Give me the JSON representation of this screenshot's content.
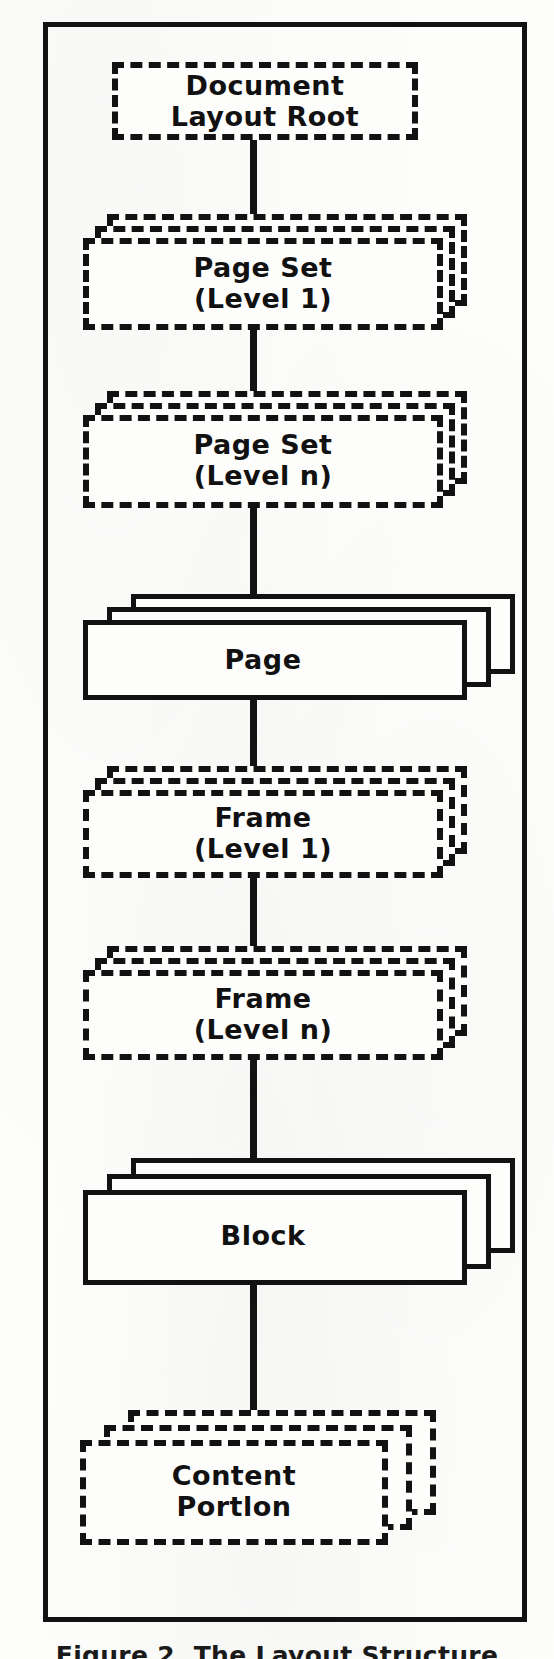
{
  "figure": {
    "caption": "Figure 2. The Layout Structure",
    "border_color": "#121212",
    "paper_color": "#fdfdfc",
    "ink_color": "#121212"
  },
  "diagram": {
    "type": "tree-hierarchy",
    "orientation": "vertical",
    "node_count": 8,
    "connector_count": 7,
    "nodes": [
      {
        "id": "document-layout-root",
        "label": "Document\nLayout Root",
        "line_style": "dashed",
        "stack_layers": 1,
        "x": 112,
        "y": 62,
        "width": 306,
        "height": 78
      },
      {
        "id": "page-set-level-1",
        "label": "Page Set\n(Level 1)",
        "line_style": "dashed",
        "stack_layers": 3,
        "x": 83,
        "y": 238,
        "width": 360,
        "height": 92
      },
      {
        "id": "page-set-level-n",
        "label": "Page Set\n(Level n)",
        "line_style": "dashed",
        "stack_layers": 3,
        "x": 83,
        "y": 415,
        "width": 360,
        "height": 93
      },
      {
        "id": "page",
        "label": "Page",
        "line_style": "solid",
        "stack_layers": 3,
        "x": 83,
        "y": 620,
        "width": 384,
        "height": 80
      },
      {
        "id": "frame-level-1",
        "label": "Frame\n(Level 1)",
        "line_style": "dashed",
        "stack_layers": 3,
        "x": 83,
        "y": 790,
        "width": 360,
        "height": 88
      },
      {
        "id": "frame-level-n",
        "label": "Frame\n(Level n)",
        "line_style": "dashed",
        "stack_layers": 3,
        "x": 83,
        "y": 970,
        "width": 360,
        "height": 90
      },
      {
        "id": "block",
        "label": "Block",
        "line_style": "solid",
        "stack_layers": 3,
        "x": 83,
        "y": 1190,
        "width": 384,
        "height": 95
      },
      {
        "id": "content-portion",
        "label": "Content\nPortlon",
        "line_style": "dashed",
        "stack_layers": 3,
        "x": 80,
        "y": 1440,
        "width": 308,
        "height": 105
      }
    ],
    "edges": [
      {
        "id": "edge-root-to-pageset1",
        "from": "document-layout-root",
        "to": "page-set-level-1"
      },
      {
        "id": "edge-pageset1-to-pagesetn",
        "from": "page-set-level-1",
        "to": "page-set-level-n"
      },
      {
        "id": "edge-pagesetn-to-page",
        "from": "page-set-level-n",
        "to": "page"
      },
      {
        "id": "edge-page-to-frame1",
        "from": "page",
        "to": "frame-level-1"
      },
      {
        "id": "edge-frame1-to-framen",
        "from": "frame-level-1",
        "to": "frame-level-n"
      },
      {
        "id": "edge-framen-to-block",
        "from": "frame-level-n",
        "to": "block"
      },
      {
        "id": "edge-block-to-content",
        "from": "block",
        "to": "content-portion"
      }
    ],
    "labels": {
      "document_layout_root": "Document\nLayout Root",
      "page_set_level_1": "Page Set\n(Level 1)",
      "page_set_level_n": "Page Set\n(Level n)",
      "page": "Page",
      "frame_level_1": "Frame\n(Level 1)",
      "frame_level_n": "Frame\n(Level n)",
      "block": "Block",
      "content_portion": "Content\nPortlon"
    }
  }
}
